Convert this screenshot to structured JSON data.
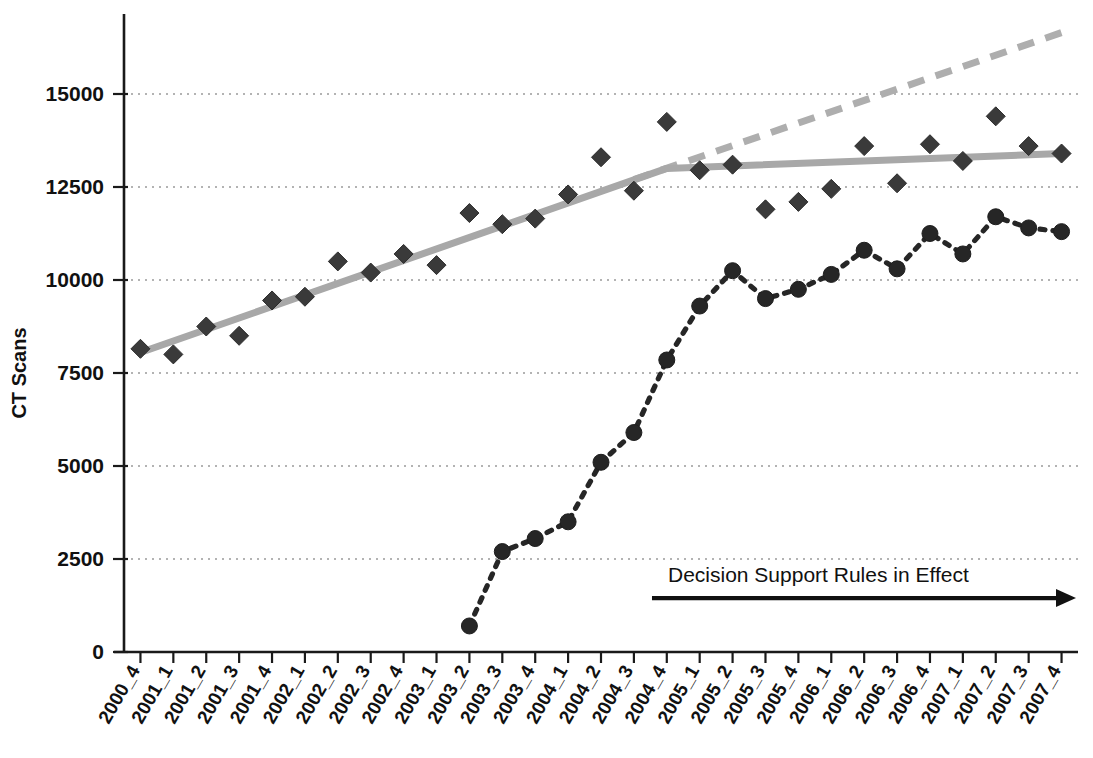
{
  "chart_data": {
    "type": "scatter",
    "title": "",
    "xlabel": "",
    "ylabel": "CT Scans",
    "ylim": [
      0,
      16500
    ],
    "yticks": [
      0,
      2500,
      5000,
      7500,
      10000,
      12500,
      15000
    ],
    "ytick_labels": [
      "0",
      "2500",
      "5000",
      "7500",
      "10000",
      "12500",
      "15000"
    ],
    "grid": true,
    "legend_position": "none",
    "categories": [
      "2000_4",
      "2001_1",
      "2001_2",
      "2001_3",
      "2001_4",
      "2002_1",
      "2002_2",
      "2002_3",
      "2002_4",
      "2003_1",
      "2003_2",
      "2003_3",
      "2003_4",
      "2004_1",
      "2004_2",
      "2004_3",
      "2004_4",
      "2005_1",
      "2005_2",
      "2005_3",
      "2005_4",
      "2006_1",
      "2006_2",
      "2006_3",
      "2006_4",
      "2007_1",
      "2007_2",
      "2007_3",
      "2007_4"
    ],
    "series": [
      {
        "name": "Total CT Scans",
        "marker": "diamond",
        "values": [
          8150,
          8000,
          8750,
          8500,
          9450,
          9550,
          10500,
          10200,
          10700,
          10400,
          11800,
          11500,
          11650,
          12300,
          13300,
          12400,
          14250,
          12950,
          13100,
          11900,
          12100,
          12450,
          13600,
          12600,
          13650,
          13200,
          14400,
          13600,
          13400
        ]
      },
      {
        "name": "CT Scans with Decision Support",
        "marker": "circle",
        "values": [
          null,
          null,
          null,
          null,
          null,
          null,
          null,
          null,
          null,
          null,
          700,
          2700,
          3050,
          3500,
          5100,
          5900,
          7850,
          9300,
          10250,
          9500,
          9750,
          10150,
          10800,
          10300,
          11250,
          10700,
          11700,
          11400,
          11300
        ]
      }
    ],
    "trend_solid": {
      "name": "fitted trend (pre/post)",
      "points": [
        {
          "x": "2000_4",
          "y": 8050
        },
        {
          "x": "2004_4",
          "y": 13000
        },
        {
          "x": "2007_4",
          "y": 13400
        }
      ]
    },
    "trend_dashed": {
      "name": "counterfactual projection",
      "points": [
        {
          "x": "2004_3",
          "y": 12700
        },
        {
          "x": "2007_4",
          "y": 16650
        }
      ]
    },
    "annotations": [
      {
        "text": "Decision Support Rules in Effect",
        "start_x": "2004_4",
        "end_x": "2007_4",
        "y": 1450
      }
    ]
  },
  "axes": {
    "ylabel": "CT Scans"
  }
}
